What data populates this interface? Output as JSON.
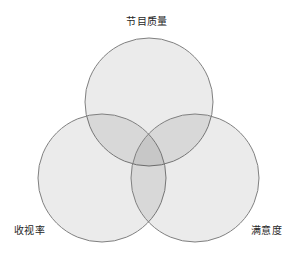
{
  "figure": {
    "width": 294,
    "height": 258,
    "background_color": "#ffffff",
    "stroke_color": "#808080",
    "stroke_width": 1,
    "set_fill_color": "#ebebeb",
    "double_overlap_color": "#d6d6d6",
    "triple_overlap_color": "#c4c4c4"
  },
  "chart_data": {
    "type": "venn",
    "title": "",
    "sets": [
      {
        "id": "program-quality",
        "label": "节目质量",
        "label_position": "top-center",
        "cx": 149,
        "cy": 102,
        "r": 64
      },
      {
        "id": "viewership-rating",
        "label": "收视率",
        "label_position": "bottom-left",
        "cx": 102,
        "cy": 178,
        "r": 64
      },
      {
        "id": "satisfaction",
        "label": "满意度",
        "label_position": "bottom-right",
        "cx": 195,
        "cy": 178,
        "r": 64
      }
    ],
    "region_labels": [],
    "legend": null,
    "grid": false
  },
  "labels": {
    "top": "节目质量",
    "bottom_left": "收视率",
    "bottom_right": "满意度"
  }
}
